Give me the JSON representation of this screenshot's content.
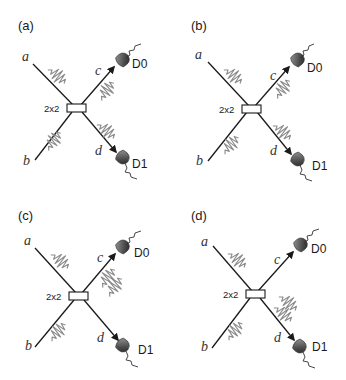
{
  "figure": {
    "bs_label": "2x2",
    "ports": {
      "a": "a",
      "b": "b",
      "c": "c",
      "d": "d"
    },
    "detectors": {
      "d0": "D0",
      "d1": "D1"
    },
    "colors": {
      "beam": "#1a1a1a",
      "wave": "#8a8a8a",
      "detector": "#4a4a4a"
    },
    "panels": [
      {
        "label": "(a)",
        "inputs": [
          "a",
          "b"
        ],
        "outputs": [
          "c",
          "d"
        ],
        "photons_c": 1,
        "photons_d": 1
      },
      {
        "label": "(b)",
        "inputs": [
          "a",
          "b"
        ],
        "outputs": [
          "c",
          "d"
        ],
        "photons_c": 1,
        "photons_d": 1
      },
      {
        "label": "(c)",
        "inputs": [
          "a",
          "b"
        ],
        "outputs": [
          "c",
          "d"
        ],
        "photons_c": 2,
        "photons_d": 0
      },
      {
        "label": "(d)",
        "inputs": [
          "a",
          "b"
        ],
        "outputs": [
          "c",
          "d"
        ],
        "photons_c": 0,
        "photons_d": 2
      }
    ]
  }
}
